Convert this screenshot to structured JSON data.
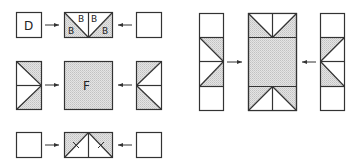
{
  "diagram": {
    "colors": {
      "stroke": "#333333",
      "fill_shaded": "#d6d6d6",
      "background": "#ffffff"
    },
    "left_group": {
      "row1": {
        "left_label": "D",
        "center_labels": [
          "B",
          "B",
          "B",
          "B"
        ],
        "right_label": ""
      },
      "row2": {
        "center_label": "F"
      },
      "row3": {
        "left_label": "",
        "right_label": ""
      }
    },
    "right_group": {
      "left_column_cells": 4,
      "center_piece": "shaded rectangle with triangular notches",
      "right_column_cells": 4
    }
  }
}
